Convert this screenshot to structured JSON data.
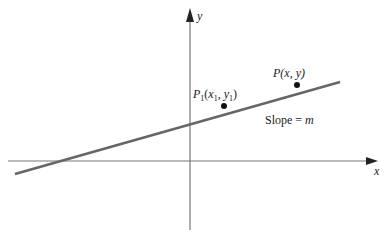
{
  "diagram": {
    "type": "point-slope line diagram",
    "axes": {
      "x_label": "x",
      "y_label": "y",
      "color": "#555555"
    },
    "line": {
      "color": "#666666",
      "slope_label_prefix": "Slope = ",
      "slope_symbol": "m"
    },
    "points": [
      {
        "id": "P1",
        "name": "P",
        "subscript": "1",
        "coords_open": "(",
        "x": "x",
        "x_sub": "1",
        "sep": ", ",
        "y": "y",
        "y_sub": "1",
        "coords_close": ")"
      },
      {
        "id": "P",
        "name": "P",
        "coords": "(x, y)"
      }
    ],
    "colors": {
      "point": "#111111",
      "text": "#1a1a1a"
    }
  }
}
